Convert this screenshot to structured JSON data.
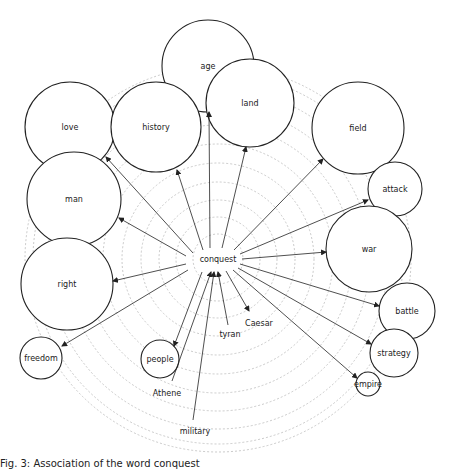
{
  "diagram": {
    "type": "word-association-radial",
    "center": {
      "label": "conquest",
      "x": 218,
      "y": 259
    },
    "rings": {
      "count": 11,
      "radii": [
        25,
        42,
        59,
        77,
        96,
        115,
        134,
        152,
        170,
        185,
        193
      ],
      "color": "#bdbdbd"
    },
    "nodes": [
      {
        "id": "age",
        "label": "age",
        "x": 208,
        "y": 66,
        "r": 46,
        "circle": true
      },
      {
        "id": "land",
        "label": "land",
        "x": 250,
        "y": 103,
        "r": 44,
        "circle": true
      },
      {
        "id": "love",
        "label": "love",
        "x": 70,
        "y": 127,
        "r": 45,
        "circle": true
      },
      {
        "id": "history",
        "label": "history",
        "x": 156,
        "y": 127,
        "r": 45,
        "circle": true
      },
      {
        "id": "field",
        "label": "field",
        "x": 358,
        "y": 128,
        "r": 46,
        "circle": true
      },
      {
        "id": "man",
        "label": "man",
        "x": 74,
        "y": 199,
        "r": 47,
        "circle": true
      },
      {
        "id": "attack",
        "label": "attack",
        "x": 395,
        "y": 189,
        "r": 27,
        "circle": true
      },
      {
        "id": "war",
        "label": "war",
        "x": 369,
        "y": 249,
        "r": 43,
        "circle": true
      },
      {
        "id": "right",
        "label": "right",
        "x": 67,
        "y": 284,
        "r": 46,
        "circle": true
      },
      {
        "id": "battle",
        "label": "battle",
        "x": 407,
        "y": 311,
        "r": 28,
        "circle": true
      },
      {
        "id": "strategy",
        "label": "strategy",
        "x": 394,
        "y": 353,
        "r": 24,
        "circle": true
      },
      {
        "id": "empire",
        "label": "empire",
        "x": 368,
        "y": 384,
        "r": 12,
        "circle": true
      },
      {
        "id": "freedom",
        "label": "freedom",
        "x": 41,
        "y": 358,
        "r": 21,
        "circle": true
      },
      {
        "id": "people",
        "label": "people",
        "x": 160,
        "y": 359,
        "r": 19,
        "circle": true
      },
      {
        "id": "caesar",
        "label": "Caesar",
        "x": 259,
        "y": 323,
        "r": 0,
        "circle": false
      },
      {
        "id": "tyran",
        "label": "tyran",
        "x": 230,
        "y": 334,
        "r": 0,
        "circle": false
      },
      {
        "id": "athene",
        "label": "Athene",
        "x": 167,
        "y": 393,
        "r": 0,
        "circle": false
      },
      {
        "id": "military",
        "label": "military",
        "x": 195,
        "y": 431,
        "r": 0,
        "circle": false
      }
    ],
    "edges": [
      {
        "to": "age",
        "x1": 210,
        "y1": 248,
        "x2": 209,
        "y2": 112,
        "arrow": "end"
      },
      {
        "to": "land",
        "x1": 222,
        "y1": 248,
        "x2": 246,
        "y2": 147,
        "arrow": "end"
      },
      {
        "to": "history",
        "x1": 203,
        "y1": 250,
        "x2": 177,
        "y2": 170,
        "arrow": "end"
      },
      {
        "to": "love",
        "x1": 193,
        "y1": 253,
        "x2": 106,
        "y2": 157,
        "arrow": "end"
      },
      {
        "to": "field",
        "x1": 234,
        "y1": 250,
        "x2": 323,
        "y2": 159,
        "arrow": "end"
      },
      {
        "to": "man",
        "x1": 186,
        "y1": 256,
        "x2": 119,
        "y2": 218,
        "arrow": "end"
      },
      {
        "to": "attack",
        "x1": 240,
        "y1": 254,
        "x2": 368,
        "y2": 200,
        "arrow": "end"
      },
      {
        "to": "war",
        "x1": 242,
        "y1": 259,
        "x2": 326,
        "y2": 252,
        "arrow": "end"
      },
      {
        "to": "right",
        "x1": 186,
        "y1": 264,
        "x2": 113,
        "y2": 281,
        "arrow": "end"
      },
      {
        "to": "battle",
        "x1": 240,
        "y1": 264,
        "x2": 379,
        "y2": 306,
        "arrow": "end"
      },
      {
        "to": "strategy",
        "x1": 238,
        "y1": 268,
        "x2": 371,
        "y2": 344,
        "arrow": "end"
      },
      {
        "to": "empire",
        "x1": 233,
        "y1": 270,
        "x2": 357,
        "y2": 378,
        "arrow": "end"
      },
      {
        "to": "freedom",
        "x1": 188,
        "y1": 270,
        "x2": 62,
        "y2": 346,
        "arrow": "end"
      },
      {
        "to": "people",
        "x1": 202,
        "y1": 272,
        "x2": 174,
        "y2": 346,
        "arrow": "end"
      },
      {
        "from": "caesar",
        "x1": 226,
        "y1": 271,
        "x2": 249,
        "y2": 311,
        "arrow": "end"
      },
      {
        "from": "tyran",
        "x1": 228,
        "y1": 325,
        "x2": 218,
        "y2": 272,
        "arrow": "end"
      },
      {
        "from": "athene",
        "x1": 172,
        "y1": 381,
        "x2": 211,
        "y2": 272,
        "arrow": "end"
      },
      {
        "from": "military",
        "x1": 193,
        "y1": 420,
        "x2": 214,
        "y2": 272,
        "arrow": "end"
      }
    ]
  },
  "caption": {
    "text": "Fig. 3: Association of the word conquest"
  }
}
